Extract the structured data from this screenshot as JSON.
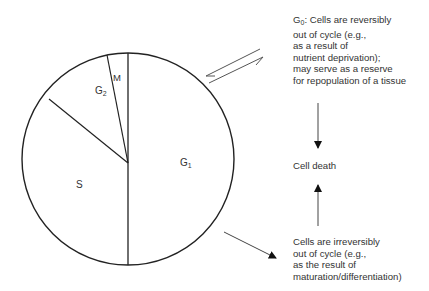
{
  "diagram": {
    "phases": [
      {
        "id": "G1",
        "label": "G",
        "sub": "1"
      },
      {
        "id": "S",
        "label": "S",
        "sub": ""
      },
      {
        "id": "G2",
        "label": "G",
        "sub": "2"
      },
      {
        "id": "M",
        "label": "M",
        "sub": ""
      }
    ],
    "g0_note": {
      "prefix": "G",
      "sub": "0",
      "text": ": Cells are reversibly\nout of cycle (e.g.,\nas a result of\nnutrient deprivation);\nmay serve as a reserve\nfor repopulation of a tissue"
    },
    "cell_death": "Cell death",
    "irreversible_note": "Cells are irreversibly\nout of cycle (e.g.,\nas the result of\nmaturation/differentiation)",
    "arrows": [
      {
        "from": "cycle",
        "to": "G0",
        "type": "bidirectional"
      },
      {
        "from": "G0",
        "to": "cell-death",
        "type": "down"
      },
      {
        "from": "irreversible",
        "to": "cell-death",
        "type": "up"
      },
      {
        "from": "cycle",
        "to": "irreversible",
        "type": "diagonal"
      }
    ],
    "colors": {
      "line": "#222222",
      "text": "#333333",
      "background": "#ffffff"
    }
  }
}
